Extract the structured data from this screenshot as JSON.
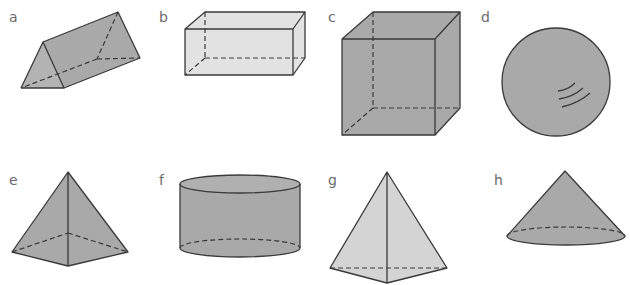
{
  "figure": {
    "colors": {
      "fill_dark": "#a9a9a9",
      "fill_light": "#dcdcdc",
      "stroke": "#3a3a3a",
      "label": "#6b6b6b"
    },
    "shapes": [
      {
        "label": "a",
        "name": "triangular prism"
      },
      {
        "label": "b",
        "name": "cuboid"
      },
      {
        "label": "c",
        "name": "cube"
      },
      {
        "label": "d",
        "name": "sphere"
      },
      {
        "label": "e",
        "name": "square-based pyramid"
      },
      {
        "label": "f",
        "name": "cylinder"
      },
      {
        "label": "g",
        "name": "triangular-based pyramid"
      },
      {
        "label": "h",
        "name": "cone"
      }
    ]
  }
}
